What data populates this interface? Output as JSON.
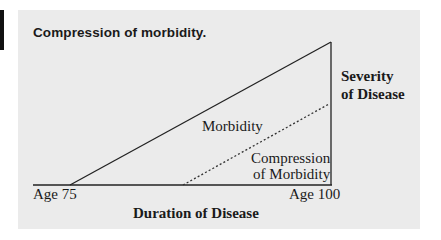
{
  "figure": {
    "title": "Compression of morbidity.",
    "labels": {
      "morbidity": "Morbidity",
      "compression_line1": "Compression",
      "compression_line2": "of Morbidity",
      "severity_line1": "Severity",
      "severity_line2": "of Disease",
      "x_start": "Age 75",
      "x_end": "Age 100",
      "x_axis": "Duration of Disease"
    },
    "colors": {
      "panel_background": "#ebebeb",
      "line": "#222222",
      "text": "#1a1a1a",
      "side_bar": "#111111"
    },
    "shapes": {
      "baseline": {
        "x1": 33,
        "y1": 185,
        "x2": 332,
        "y2": 185
      },
      "morbidity_diagonal": {
        "x1": 70,
        "y1": 185,
        "x2": 331,
        "y2": 42
      },
      "severity_vertical": {
        "x1": 331,
        "y1": 42,
        "x2": 331,
        "y2": 185
      },
      "compression_dotted": {
        "x1": 183,
        "y1": 185,
        "x2": 329,
        "y2": 104
      }
    }
  }
}
